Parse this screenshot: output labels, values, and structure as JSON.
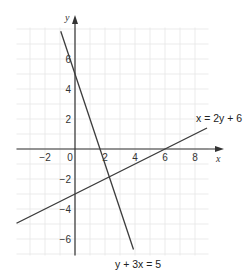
{
  "chart_data": {
    "type": "line",
    "title": "",
    "xlabel": "x",
    "ylabel": "y",
    "xlim": [
      -3.9,
      8.9
    ],
    "ylim": [
      -7.1,
      8.1
    ],
    "grid": true,
    "grid_step": 1,
    "x_ticks": [
      -2,
      0,
      2,
      4,
      6,
      8
    ],
    "y_ticks": [
      6,
      4,
      2,
      -2,
      -4,
      -6
    ],
    "x_tick_labels": [
      "−2",
      "0",
      "2",
      "4",
      "6",
      "8"
    ],
    "y_tick_labels": [
      "6",
      "4",
      "2",
      "−2",
      "−4",
      "−6"
    ],
    "series": [
      {
        "name": "y + 3x = 5",
        "equation": "y = 5 - 3x",
        "x": [
          -0.95,
          3.9
        ],
        "y": [
          7.85,
          -6.7
        ],
        "label_position": "bottom"
      },
      {
        "name": "x = 2y + 6",
        "equation": "y = (x - 6) / 2",
        "x": [
          -3.9,
          8.8
        ],
        "y": [
          -4.95,
          1.4
        ],
        "label_position": "top-right"
      }
    ],
    "intersection": {
      "x": 2.43,
      "y": -1.71
    }
  },
  "labels": {
    "x_axis": "x",
    "y_axis": "y",
    "line1": "y + 3x = 5",
    "line2": "x = 2y + 6"
  },
  "colors": {
    "grid": "#e6e6e6",
    "axis": "#333333",
    "line": "#3a3a3a",
    "text": "#333333"
  }
}
